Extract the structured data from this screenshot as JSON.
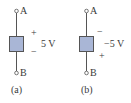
{
  "figure": {
    "panels": [
      {
        "id": "a",
        "caption": "(a)",
        "terminal_top": "A",
        "terminal_bottom": "B",
        "polarity_top": "+",
        "polarity_bottom": "−",
        "voltage": "5 V"
      },
      {
        "id": "b",
        "caption": "(b)",
        "terminal_top": "A",
        "terminal_bottom": "B",
        "polarity_top": "−",
        "polarity_bottom": "+",
        "voltage": "−5 V"
      }
    ],
    "colors": {
      "element_fill": "#a9b6d6",
      "element_stroke": "#555555",
      "wire": "#555555"
    }
  }
}
